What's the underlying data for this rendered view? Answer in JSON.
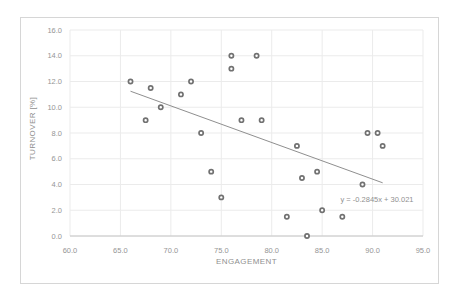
{
  "chart_data": {
    "type": "scatter",
    "title": "",
    "xlabel": "ENGAGEMENT",
    "ylabel": "TURNOVER [%]",
    "xlim": [
      60.0,
      95.0
    ],
    "ylim": [
      0.0,
      16.0
    ],
    "x_tick_labels": [
      "60.0",
      "65.0",
      "70.0",
      "75.0",
      "80.0",
      "85.0",
      "90.0",
      "95.0"
    ],
    "y_tick_labels": [
      "0.0",
      "2.0",
      "4.0",
      "6.0",
      "8.0",
      "10.0",
      "12.0",
      "14.0",
      "16.0"
    ],
    "grid": true,
    "legend": "none",
    "marker_style": "open-circle",
    "points": [
      [
        66,
        12.0
      ],
      [
        67.5,
        9.0
      ],
      [
        68,
        11.5
      ],
      [
        69,
        10.0
      ],
      [
        71,
        11.0
      ],
      [
        72,
        12.0
      ],
      [
        73,
        8.0
      ],
      [
        74,
        5.0
      ],
      [
        75,
        3.0
      ],
      [
        76,
        14.0
      ],
      [
        76,
        13.0
      ],
      [
        77,
        9.0
      ],
      [
        78.5,
        14.0
      ],
      [
        79,
        9.0
      ],
      [
        81.5,
        1.5
      ],
      [
        82.5,
        7.0
      ],
      [
        83,
        4.5
      ],
      [
        83.5,
        0.0
      ],
      [
        84.5,
        5.0
      ],
      [
        85,
        2.0
      ],
      [
        87,
        1.5
      ],
      [
        89,
        4.0
      ],
      [
        89.5,
        8.0
      ],
      [
        90.5,
        8.0
      ],
      [
        91,
        7.0
      ]
    ],
    "trendline": {
      "equation_label": "y = -0.2845x + 30.021",
      "slope": -0.2845,
      "intercept": 30.021,
      "x_start": 66,
      "x_end": 91
    },
    "colors": {
      "point_stroke": "#717171",
      "point_fill": "#ffffff",
      "trend_line": "#8f8f8f",
      "gridline": "#ebebeb",
      "axis_line": "#c6c6c6",
      "tick_text": "#959595",
      "frame_border": "#d6d6d6",
      "background": "#ffffff"
    }
  }
}
